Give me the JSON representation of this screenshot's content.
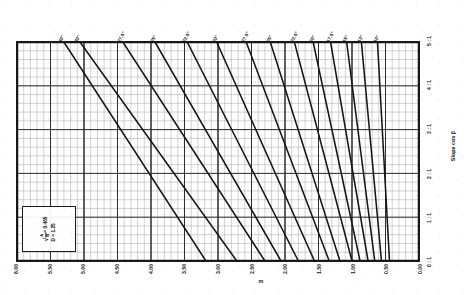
{
  "chart_data": {
    "type": "line",
    "title": "",
    "subtitle": "",
    "xlabel": "m",
    "ylabel": "Slope cos β",
    "grid": true,
    "legend_position": "bottom-left",
    "x_axis": {
      "label": "m",
      "direction": "decreasing-left-to-right",
      "ticks": [
        "6.00",
        "5.50",
        "5.00",
        "4.50",
        "4.00",
        "3.50",
        "3.00",
        "2.50",
        "2.00",
        "1.50",
        "1.00",
        "0.50",
        "0.00"
      ],
      "values": [
        6.0,
        5.5,
        5.0,
        4.5,
        4.0,
        3.5,
        3.0,
        2.5,
        2.0,
        1.5,
        1.0,
        0.5,
        0.0
      ],
      "xlim": [
        6.0,
        0.0
      ],
      "minor_tick_step": 0.1
    },
    "y_axis": {
      "label": "Slope cos β",
      "ticks": [
        "0 : 1",
        "1 : 1",
        "2 : 1",
        "3 : 1",
        "4 : 1",
        "5 : 1"
      ],
      "values": [
        0,
        1,
        2,
        3,
        4,
        5
      ],
      "ylim": [
        0,
        5
      ],
      "minor_tick_step": 0.2
    },
    "series": [
      {
        "name": "40°",
        "angle_deg": 40,
        "label": "40°",
        "x_top": 5.3,
        "x_bottom": 3.18
      },
      {
        "name": "30°",
        "angle_deg": 30,
        "label": "30°",
        "x_top": 5.06,
        "x_bottom": 2.72
      },
      {
        "name": "27.5°",
        "angle_deg": 27.5,
        "label": "27.5°",
        "x_top": 4.42,
        "x_bottom": 2.3
      },
      {
        "name": "25°",
        "angle_deg": 25,
        "label": "25°",
        "x_top": 3.94,
        "x_bottom": 2.06
      },
      {
        "name": "22.5°",
        "angle_deg": 22.5,
        "label": "22.5°",
        "x_top": 3.46,
        "x_bottom": 1.8
      },
      {
        "name": "20°",
        "angle_deg": 20,
        "label": "20°",
        "x_top": 3.02,
        "x_bottom": 1.56
      },
      {
        "name": "27.5°b",
        "angle_deg": 17.5,
        "label": "27.5°",
        "x_top": 2.58,
        "x_bottom": 1.34
      },
      {
        "name": "25°b",
        "angle_deg": 15,
        "label": "25°",
        "x_top": 2.22,
        "x_bottom": 1.18
      },
      {
        "name": "22.5°c",
        "angle_deg": 12.5,
        "label": "22.5°",
        "x_top": 1.86,
        "x_bottom": 1.0
      },
      {
        "name": "20°b",
        "angle_deg": 11,
        "label": "20°",
        "x_top": 1.58,
        "x_bottom": 0.88
      },
      {
        "name": "17.5°",
        "angle_deg": 10,
        "label": "17.5°",
        "x_top": 1.32,
        "x_bottom": 0.76
      },
      {
        "name": "15°",
        "angle_deg": 9,
        "label": "15°",
        "x_top": 1.08,
        "x_bottom": 0.66
      },
      {
        "name": "13°",
        "angle_deg": 8,
        "label": "13°",
        "x_top": 0.86,
        "x_bottom": 0.56
      },
      {
        "name": "10°",
        "angle_deg": 7,
        "label": "10°",
        "x_top": 0.62,
        "x_bottom": 0.44
      }
    ],
    "annotations": {
      "formula_line1_radical": "√",
      "formula_line1_num": "A",
      "formula_line1_den": "B",
      "formula_line1_value": "= 0.465",
      "formula_line2_symbol": "D",
      "formula_line2_value": "= 1.25"
    }
  },
  "top_axis": {
    "labels": [
      "40°",
      "30°",
      "27.5°",
      "25°",
      "22.5°",
      "20°",
      "27.5°",
      "25°",
      "22.5°",
      "20°",
      "17.5°",
      "15°",
      "13°",
      "10°"
    ]
  },
  "bottom_axis": {
    "title": "m",
    "labels": [
      "6.00",
      "5.50",
      "5.00",
      "4.50",
      "4.00",
      "3.50",
      "3.00",
      "2.50",
      "2.00",
      "1.50",
      "1.00",
      "0.50",
      "0.00"
    ]
  },
  "right_axis": {
    "title": "Slope cos β",
    "labels": [
      "5 : 1",
      "4 : 1",
      "3 : 1",
      "2 : 1",
      "1 : 1",
      "0 : 1"
    ]
  },
  "colors": {
    "ink": "#151515",
    "grid_minor": "#9a9a9a",
    "grid_major": "#2e2e2e",
    "paper": "#ffffff"
  }
}
